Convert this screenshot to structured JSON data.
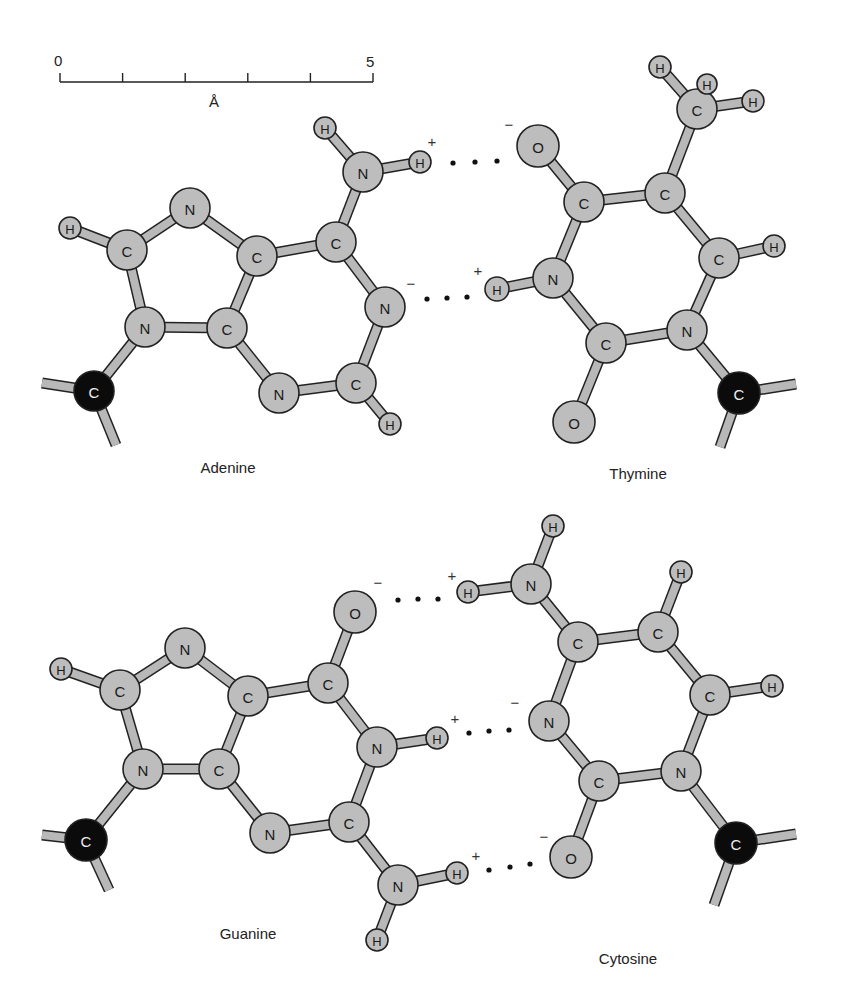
{
  "colors": {
    "atom_fill": "#bdbdbd",
    "sugar_carbon_fill": "#0b0b0b",
    "bond_fill": "#b8b8b8",
    "outline": "#222222",
    "text": "#222222"
  },
  "scale_bar": {
    "start_label": "0",
    "end_label": "5",
    "unit_label": "Å",
    "x0": 60,
    "x1": 373,
    "y": 82,
    "ticks": 6
  },
  "molecules": [
    {
      "name": "Adenine",
      "label_x": 228,
      "label_y": 473,
      "atoms": [
        {
          "id": "a_h_amino_top",
          "el": "H",
          "x": 325,
          "y": 128,
          "r": 11
        },
        {
          "id": "a_n_amino",
          "el": "N",
          "x": 363,
          "y": 172,
          "r": 20
        },
        {
          "id": "a_h_amino_bond",
          "el": "H",
          "x": 420,
          "y": 162,
          "r": 11
        },
        {
          "id": "a_c6",
          "el": "C",
          "x": 336,
          "y": 242,
          "r": 20
        },
        {
          "id": "a_n1",
          "el": "N",
          "x": 385,
          "y": 307,
          "r": 20
        },
        {
          "id": "a_c2",
          "el": "C",
          "x": 356,
          "y": 383,
          "r": 20
        },
        {
          "id": "a_h2",
          "el": "H",
          "x": 390,
          "y": 424,
          "r": 11
        },
        {
          "id": "a_n3",
          "el": "N",
          "x": 279,
          "y": 393,
          "r": 20
        },
        {
          "id": "a_c4",
          "el": "C",
          "x": 227,
          "y": 328,
          "r": 20
        },
        {
          "id": "a_c5",
          "el": "C",
          "x": 257,
          "y": 256,
          "r": 20
        },
        {
          "id": "a_n7",
          "el": "N",
          "x": 190,
          "y": 208,
          "r": 20
        },
        {
          "id": "a_c8",
          "el": "C",
          "x": 127,
          "y": 250,
          "r": 20
        },
        {
          "id": "a_h8",
          "el": "H",
          "x": 70,
          "y": 228,
          "r": 11
        },
        {
          "id": "a_n9",
          "el": "N",
          "x": 145,
          "y": 327,
          "r": 20
        },
        {
          "id": "a_c1p",
          "el": "C",
          "x": 94,
          "y": 391,
          "r": 20,
          "sugar": true
        }
      ],
      "bonds": [
        [
          "a_h_amino_top",
          "a_n_amino"
        ],
        [
          "a_n_amino",
          "a_h_amino_bond"
        ],
        [
          "a_n_amino",
          "a_c6"
        ],
        [
          "a_c6",
          "a_n1"
        ],
        [
          "a_n1",
          "a_c2"
        ],
        [
          "a_c2",
          "a_h2"
        ],
        [
          "a_c2",
          "a_n3"
        ],
        [
          "a_n3",
          "a_c4"
        ],
        [
          "a_c4",
          "a_c5"
        ],
        [
          "a_c5",
          "a_c6"
        ],
        [
          "a_c5",
          "a_n7"
        ],
        [
          "a_n7",
          "a_c8"
        ],
        [
          "a_c8",
          "a_h8"
        ],
        [
          "a_c8",
          "a_n9"
        ],
        [
          "a_n9",
          "a_c4"
        ],
        [
          "a_n9",
          "a_c1p"
        ]
      ],
      "stubs": [
        {
          "from": "a_c1p",
          "x": 42,
          "y": 383
        },
        {
          "from": "a_c1p",
          "x": 116,
          "y": 445
        }
      ]
    },
    {
      "name": "Thymine",
      "label_x": 638,
      "label_y": 479,
      "atoms": [
        {
          "id": "t_o4",
          "el": "O",
          "x": 538,
          "y": 146,
          "r": 21
        },
        {
          "id": "t_c4",
          "el": "C",
          "x": 584,
          "y": 202,
          "r": 20
        },
        {
          "id": "t_c5",
          "el": "C",
          "x": 665,
          "y": 193,
          "r": 20
        },
        {
          "id": "t_cm",
          "el": "C",
          "x": 697,
          "y": 109,
          "r": 20
        },
        {
          "id": "t_hm1",
          "el": "H",
          "x": 660,
          "y": 67,
          "r": 11
        },
        {
          "id": "t_hm2",
          "el": "H",
          "x": 707,
          "y": 84,
          "r": 10
        },
        {
          "id": "t_hm3",
          "el": "H",
          "x": 753,
          "y": 101,
          "r": 11
        },
        {
          "id": "t_c6",
          "el": "C",
          "x": 719,
          "y": 258,
          "r": 20
        },
        {
          "id": "t_h6",
          "el": "H",
          "x": 774,
          "y": 246,
          "r": 11
        },
        {
          "id": "t_n1",
          "el": "N",
          "x": 687,
          "y": 330,
          "r": 20
        },
        {
          "id": "t_c2",
          "el": "C",
          "x": 606,
          "y": 343,
          "r": 20
        },
        {
          "id": "t_o2",
          "el": "O",
          "x": 574,
          "y": 422,
          "r": 21
        },
        {
          "id": "t_n3",
          "el": "N",
          "x": 553,
          "y": 278,
          "r": 20
        },
        {
          "id": "t_h3",
          "el": "H",
          "x": 497,
          "y": 289,
          "r": 12
        },
        {
          "id": "t_c1p",
          "el": "C",
          "x": 739,
          "y": 393,
          "r": 21,
          "sugar": true
        }
      ],
      "bonds": [
        [
          "t_o4",
          "t_c4"
        ],
        [
          "t_c4",
          "t_c5"
        ],
        [
          "t_c5",
          "t_cm"
        ],
        [
          "t_cm",
          "t_hm1"
        ],
        [
          "t_cm",
          "t_hm2"
        ],
        [
          "t_cm",
          "t_hm3"
        ],
        [
          "t_c5",
          "t_c6"
        ],
        [
          "t_c6",
          "t_h6"
        ],
        [
          "t_c6",
          "t_n1"
        ],
        [
          "t_n1",
          "t_c2"
        ],
        [
          "t_c2",
          "t_o2"
        ],
        [
          "t_c2",
          "t_n3"
        ],
        [
          "t_n3",
          "t_h3"
        ],
        [
          "t_n3",
          "t_c4"
        ],
        [
          "t_n1",
          "t_c1p"
        ]
      ],
      "stubs": [
        {
          "from": "t_c1p",
          "x": 796,
          "y": 384
        },
        {
          "from": "t_c1p",
          "x": 720,
          "y": 447
        }
      ]
    },
    {
      "name": "Guanine",
      "label_x": 248,
      "label_y": 939,
      "atoms": [
        {
          "id": "g_o6",
          "el": "O",
          "x": 355,
          "y": 612,
          "r": 21
        },
        {
          "id": "g_c6",
          "el": "C",
          "x": 328,
          "y": 683,
          "r": 20
        },
        {
          "id": "g_n1",
          "el": "N",
          "x": 377,
          "y": 747,
          "r": 20
        },
        {
          "id": "g_h1",
          "el": "H",
          "x": 437,
          "y": 738,
          "r": 11
        },
        {
          "id": "g_c2",
          "el": "C",
          "x": 349,
          "y": 822,
          "r": 20
        },
        {
          "id": "g_n2",
          "el": "N",
          "x": 398,
          "y": 885,
          "r": 20
        },
        {
          "id": "g_h2a",
          "el": "H",
          "x": 457,
          "y": 873,
          "r": 11
        },
        {
          "id": "g_h2b",
          "el": "H",
          "x": 377,
          "y": 940,
          "r": 11
        },
        {
          "id": "g_n3",
          "el": "N",
          "x": 270,
          "y": 833,
          "r": 20
        },
        {
          "id": "g_c4",
          "el": "C",
          "x": 219,
          "y": 769,
          "r": 20
        },
        {
          "id": "g_c5",
          "el": "C",
          "x": 248,
          "y": 696,
          "r": 20
        },
        {
          "id": "g_n7",
          "el": "N",
          "x": 185,
          "y": 648,
          "r": 20
        },
        {
          "id": "g_c8",
          "el": "C",
          "x": 120,
          "y": 690,
          "r": 20
        },
        {
          "id": "g_h8",
          "el": "H",
          "x": 61,
          "y": 669,
          "r": 11
        },
        {
          "id": "g_n9",
          "el": "N",
          "x": 143,
          "y": 769,
          "r": 20
        },
        {
          "id": "g_c1p",
          "el": "C",
          "x": 86,
          "y": 840,
          "r": 21,
          "sugar": true
        }
      ],
      "bonds": [
        [
          "g_o6",
          "g_c6"
        ],
        [
          "g_c6",
          "g_n1"
        ],
        [
          "g_n1",
          "g_h1"
        ],
        [
          "g_n1",
          "g_c2"
        ],
        [
          "g_c2",
          "g_n2"
        ],
        [
          "g_n2",
          "g_h2a"
        ],
        [
          "g_n2",
          "g_h2b"
        ],
        [
          "g_c2",
          "g_n3"
        ],
        [
          "g_n3",
          "g_c4"
        ],
        [
          "g_c4",
          "g_c5"
        ],
        [
          "g_c5",
          "g_c6"
        ],
        [
          "g_c5",
          "g_n7"
        ],
        [
          "g_n7",
          "g_c8"
        ],
        [
          "g_c8",
          "g_h8"
        ],
        [
          "g_c8",
          "g_n9"
        ],
        [
          "g_n9",
          "g_c4"
        ],
        [
          "g_n9",
          "g_c1p"
        ]
      ],
      "stubs": [
        {
          "from": "g_c1p",
          "x": 42,
          "y": 835
        },
        {
          "from": "g_c1p",
          "x": 109,
          "y": 890
        }
      ]
    },
    {
      "name": "Cytosine",
      "label_x": 628,
      "label_y": 964,
      "atoms": [
        {
          "id": "c_h4a",
          "el": "H",
          "x": 553,
          "y": 526,
          "r": 11
        },
        {
          "id": "c_n4",
          "el": "N",
          "x": 531,
          "y": 584,
          "r": 20
        },
        {
          "id": "c_h4b",
          "el": "H",
          "x": 468,
          "y": 592,
          "r": 11
        },
        {
          "id": "c_c4",
          "el": "C",
          "x": 578,
          "y": 642,
          "r": 20
        },
        {
          "id": "c_c5",
          "el": "C",
          "x": 658,
          "y": 632,
          "r": 20
        },
        {
          "id": "c_h5",
          "el": "H",
          "x": 681,
          "y": 572,
          "r": 11
        },
        {
          "id": "c_c6",
          "el": "C",
          "x": 710,
          "y": 695,
          "r": 20
        },
        {
          "id": "c_h6",
          "el": "H",
          "x": 772,
          "y": 686,
          "r": 11
        },
        {
          "id": "c_n1",
          "el": "N",
          "x": 681,
          "y": 771,
          "r": 20
        },
        {
          "id": "c_c2",
          "el": "C",
          "x": 599,
          "y": 781,
          "r": 20
        },
        {
          "id": "c_o2",
          "el": "O",
          "x": 571,
          "y": 857,
          "r": 21
        },
        {
          "id": "c_n3",
          "el": "N",
          "x": 549,
          "y": 721,
          "r": 20
        },
        {
          "id": "c_c1p",
          "el": "C",
          "x": 736,
          "y": 843,
          "r": 21,
          "sugar": true
        }
      ],
      "bonds": [
        [
          "c_h4a",
          "c_n4"
        ],
        [
          "c_n4",
          "c_h4b"
        ],
        [
          "c_n4",
          "c_c4"
        ],
        [
          "c_c4",
          "c_c5"
        ],
        [
          "c_c5",
          "c_h5"
        ],
        [
          "c_c5",
          "c_c6"
        ],
        [
          "c_c6",
          "c_h6"
        ],
        [
          "c_c6",
          "c_n1"
        ],
        [
          "c_n1",
          "c_c2"
        ],
        [
          "c_c2",
          "c_o2"
        ],
        [
          "c_c2",
          "c_n3"
        ],
        [
          "c_n3",
          "c_c4"
        ],
        [
          "c_n1",
          "c_c1p"
        ]
      ],
      "stubs": [
        {
          "from": "c_c1p",
          "x": 796,
          "y": 834
        },
        {
          "from": "c_c1p",
          "x": 714,
          "y": 905
        }
      ]
    }
  ],
  "hydrogen_bonds": [
    {
      "dots": [
        [
          453,
          163
        ],
        [
          475,
          162
        ],
        [
          497,
          161
        ]
      ],
      "plus": {
        "x": 432,
        "y": 141,
        "text": "+"
      },
      "minus": {
        "x": 509,
        "y": 124,
        "text": "−"
      }
    },
    {
      "dots": [
        [
          427,
          299
        ],
        [
          447,
          298
        ],
        [
          467,
          297
        ]
      ],
      "plus": {
        "x": 478,
        "y": 270,
        "text": "+"
      },
      "minus": {
        "x": 411,
        "y": 283,
        "text": "−"
      }
    },
    {
      "dots": [
        [
          398,
          600
        ],
        [
          418,
          599
        ],
        [
          438,
          599
        ]
      ],
      "plus": {
        "x": 452,
        "y": 575,
        "text": "+"
      },
      "minus": {
        "x": 378,
        "y": 582,
        "text": "−"
      }
    },
    {
      "dots": [
        [
          469,
          733
        ],
        [
          489,
          731
        ],
        [
          509,
          730
        ]
      ],
      "plus": {
        "x": 455,
        "y": 718,
        "text": "+"
      },
      "minus": {
        "x": 515,
        "y": 702,
        "text": "−"
      }
    },
    {
      "dots": [
        [
          489,
          870
        ],
        [
          510,
          867
        ],
        [
          530,
          864
        ]
      ],
      "plus": {
        "x": 476,
        "y": 855,
        "text": "+"
      },
      "minus": {
        "x": 544,
        "y": 836,
        "text": "−"
      }
    }
  ]
}
